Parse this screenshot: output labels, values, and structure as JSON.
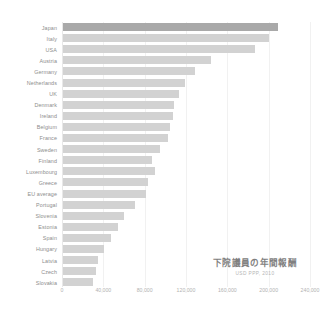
{
  "chart_data": {
    "type": "bar",
    "orientation": "horizontal",
    "title": "下院議員の年間報酬",
    "subtitle": "USD PPP, 2010",
    "xlabel": "",
    "ylabel": "",
    "xlim": [
      0,
      240000
    ],
    "grid": true,
    "legend": false,
    "highlight_category": "Japan",
    "colors": {
      "bar": "#d2d2d2",
      "bar_highlight": "#a9a9a9",
      "gridline": "#f1f1f1",
      "label_text": "#8d8d8d",
      "tick_text": "#b2b2b2",
      "title_text": "#808080",
      "subtitle_text": "#b6b6b6",
      "background": "#ffffff"
    },
    "xticks": [
      {
        "value": 0,
        "label": "0"
      },
      {
        "value": 40000,
        "label": "40,000"
      },
      {
        "value": 80000,
        "label": "80,000"
      },
      {
        "value": 120000,
        "label": "120,000"
      },
      {
        "value": 160000,
        "label": "160,000"
      },
      {
        "value": 200000,
        "label": "200,000"
      },
      {
        "value": 240000,
        "label": "240,000"
      }
    ],
    "categories": [
      "Japan",
      "Italy",
      "USA",
      "Austria",
      "Germany",
      "Netherlands",
      "UK",
      "Denmark",
      "Ireland",
      "Belgium",
      "France",
      "Sweden",
      "Finland",
      "Luxembourg",
      "Greece",
      "EU average",
      "Portugal",
      "Slovenia",
      "Estonia",
      "Spain",
      "Hungary",
      "Latvia",
      "Czech",
      "Slovakia"
    ],
    "values": [
      208000,
      199000,
      186000,
      143000,
      128000,
      118000,
      112000,
      107000,
      106000,
      104000,
      102000,
      94000,
      86000,
      89000,
      82000,
      80000,
      70000,
      59000,
      53000,
      46000,
      40000,
      34000,
      32000,
      29000
    ]
  }
}
